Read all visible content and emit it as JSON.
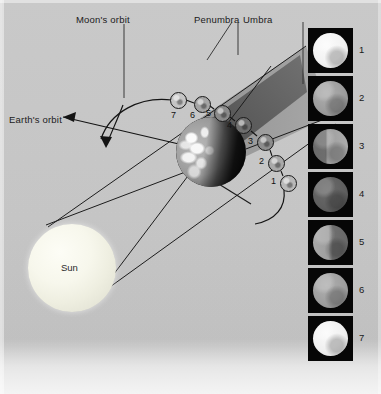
{
  "figure": {
    "title_text": "",
    "background_color": "#c9c9c9",
    "labels": {
      "moons_orbit": "Moon's orbit",
      "penumbra": "Penumbra",
      "umbra": "Umbra",
      "earths_orbit": "Earth's orbit",
      "sun": "Sun"
    }
  },
  "diagram": {
    "type": "lunar-eclipse-geometry",
    "sun": {
      "label": "Sun",
      "cx": 72,
      "cy": 268,
      "r": 44,
      "color": "#f4f4e8"
    },
    "earth": {
      "cx": 211,
      "cy": 152,
      "r": 35,
      "lit_side": "left"
    },
    "umbra": {
      "label": "Umbra",
      "color": "#6b6b6b"
    },
    "penumbra": {
      "label": "Penumbra",
      "color": "#9a9a9a"
    },
    "moon_positions": [
      {
        "number": "1",
        "cx": 288,
        "cy": 183,
        "r": 8,
        "shade": "#b9b9b9",
        "label_x": 271,
        "label_y": 179
      },
      {
        "number": "2",
        "cx": 276,
        "cy": 163,
        "r": 8,
        "shade": "#a9a9a9",
        "label_x": 262,
        "label_y": 159
      },
      {
        "number": "3",
        "cx": 265,
        "cy": 142,
        "r": 8,
        "shade": "#8d8d8d",
        "label_x": 250,
        "label_y": 139
      },
      {
        "number": "4",
        "cx": 243,
        "cy": 125,
        "r": 8,
        "shade": "#6f6f6f",
        "label_x": 229,
        "label_y": 124
      },
      {
        "number": "5",
        "cx": 222,
        "cy": 113,
        "r": 8,
        "shade": "#8a8a8a",
        "label_x": 208,
        "label_y": 112
      },
      {
        "number": "6",
        "cx": 202,
        "cy": 104,
        "r": 8,
        "shade": "#a4a4a4",
        "label_x": 190,
        "label_y": 110
      },
      {
        "number": "7",
        "cx": 178,
        "cy": 100,
        "r": 8,
        "shade": "#c2c2c2",
        "label_x": 166,
        "label_y": 110
      }
    ],
    "arrows": {
      "earths_orbit_arrow": "left-pointing",
      "moon_orbit_direction_arrow": "curved-down-left",
      "moon_entry_arrow": "curved-bottom-right"
    }
  },
  "phase_panels": {
    "caption_side": "right",
    "items": [
      {
        "number": "1",
        "phase": "full",
        "illumination": 100,
        "x": 308,
        "y": 28,
        "w": 45,
        "h": 45,
        "disc_color": "#f2f2f2"
      },
      {
        "number": "2",
        "phase": "penumbral-dim",
        "illumination": 62,
        "x": 308,
        "y": 76,
        "w": 45,
        "h": 45,
        "disc_color": "#9c9c9c"
      },
      {
        "number": "3",
        "phase": "partial-umbral-left-edge",
        "illumination": 48,
        "x": 308,
        "y": 124,
        "w": 45,
        "h": 45,
        "disc_color": "#909090"
      },
      {
        "number": "4",
        "phase": "total",
        "illumination": 18,
        "x": 308,
        "y": 172,
        "w": 45,
        "h": 45,
        "disc_color": "#5e5e5e"
      },
      {
        "number": "5",
        "phase": "partial-umbral-right-edge",
        "illumination": 46,
        "x": 308,
        "y": 220,
        "w": 45,
        "h": 45,
        "disc_color": "#8d8d8d"
      },
      {
        "number": "6",
        "phase": "penumbral-dim",
        "illumination": 64,
        "x": 308,
        "y": 268,
        "w": 45,
        "h": 45,
        "disc_color": "#9e9e9e"
      },
      {
        "number": "7",
        "phase": "full",
        "illumination": 100,
        "x": 308,
        "y": 316,
        "w": 45,
        "h": 45,
        "disc_color": "#f0f0f0"
      }
    ]
  }
}
